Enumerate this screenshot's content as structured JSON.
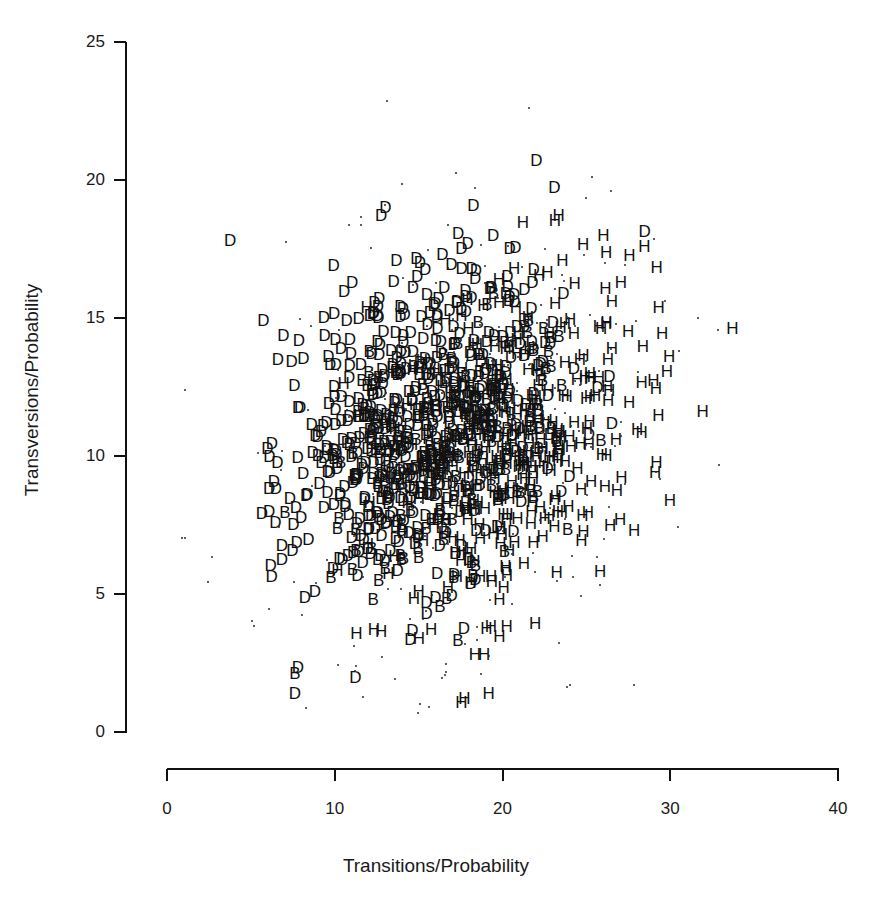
{
  "chart_data": {
    "type": "scatter",
    "title": "",
    "xlabel": "Transitions/Probability",
    "ylabel": "Transversions/Probability",
    "xlim": [
      0,
      40
    ],
    "ylim": [
      0,
      25
    ],
    "xticks": [
      0,
      10,
      20,
      30,
      40
    ],
    "yticks": [
      0,
      5,
      10,
      15,
      20,
      25
    ],
    "xtick_labels": [
      "0",
      "10",
      "20",
      "30",
      "40"
    ],
    "ytick_labels": [
      "0",
      "5",
      "10",
      "15",
      "20",
      "25"
    ],
    "grid": false,
    "legend_position": "none",
    "marker_style": "text-letters",
    "series": [
      {
        "name": "D",
        "label": "D",
        "marker": "D",
        "color": "#111111",
        "description": "Letter D markers, concentrated on the left and centre of the cloud",
        "approx_count": 620,
        "x_center": 15.0,
        "y_center": 11.2,
        "x_spread": 3.8,
        "y_spread": 3.1
      },
      {
        "name": "H",
        "label": "H",
        "marker": "H",
        "color": "#111111",
        "description": "Letter H markers, concentrated on the right side of the cloud",
        "approx_count": 380,
        "x_center": 20.6,
        "y_center": 10.6,
        "x_spread": 3.9,
        "y_spread": 3.2
      },
      {
        "name": "B",
        "label": "B",
        "marker": "B",
        "color": "#111111",
        "description": "Letter B markers, sparse, mixed through the cloud",
        "approx_count": 150,
        "x_center": 17.2,
        "y_center": 10.2,
        "x_spread": 3.6,
        "y_spread": 3.0
      },
      {
        "name": "dots",
        "label": ".",
        "marker": "dot",
        "color": "#2a2a2a",
        "description": "Small point markers scattered widely around the letter cloud",
        "approx_count": 300,
        "x_center": 18.0,
        "y_center": 11.0,
        "x_spread": 6.2,
        "y_spread": 4.6
      }
    ]
  },
  "axes": {
    "y_axis_name": "y-axis",
    "x_axis_name": "x-axis",
    "y_title": "Transversions/Probability",
    "x_title": "Transitions/Probability"
  },
  "caption": {
    "partial_text": ""
  },
  "colors": {
    "background": "#ffffff",
    "axis": "#111111",
    "marker": "#111111",
    "dot": "#2a2a2a",
    "text": "#1a1a1a"
  }
}
